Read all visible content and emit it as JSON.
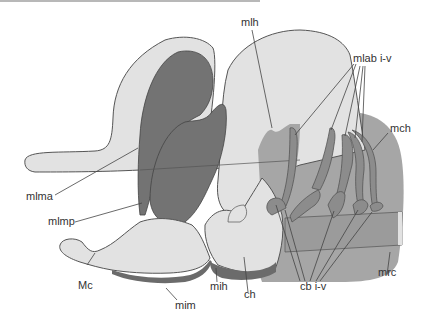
{
  "figure": {
    "type": "anatomical-diagram",
    "colors": {
      "cartilage": "#e2e2e2",
      "muscle_dark": "#737373",
      "muscle_mid": "#a6a6a6",
      "outline": "#555555",
      "label_text": "#333333"
    }
  },
  "labels": {
    "mlh": "mlh",
    "mlab": "mlab i-v",
    "mch": "mch",
    "mlma": "mlma",
    "mlmp": "mlmp",
    "mc": "Mc",
    "mim": "mim",
    "mih": "mih",
    "ch": "ch",
    "cb": "cb i-v",
    "mrc": "mrc"
  }
}
